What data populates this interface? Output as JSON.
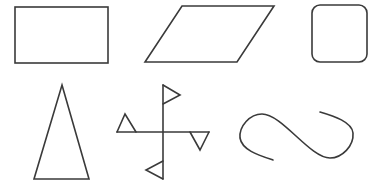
{
  "canvas": {
    "width": 382,
    "height": 191,
    "background": "#ffffff",
    "stroke_color": "#3a3a3a"
  },
  "shapes": [
    {
      "name": "rectangle",
      "row": 1,
      "col": 1
    },
    {
      "name": "parallelogram",
      "row": 1,
      "col": 2
    },
    {
      "name": "rounded-square",
      "row": 1,
      "col": 3
    },
    {
      "name": "isosceles-triangle",
      "row": 2,
      "col": 1
    },
    {
      "name": "cross-with-flags",
      "row": 2,
      "col": 2
    },
    {
      "name": "s-curve",
      "row": 2,
      "col": 3
    }
  ]
}
